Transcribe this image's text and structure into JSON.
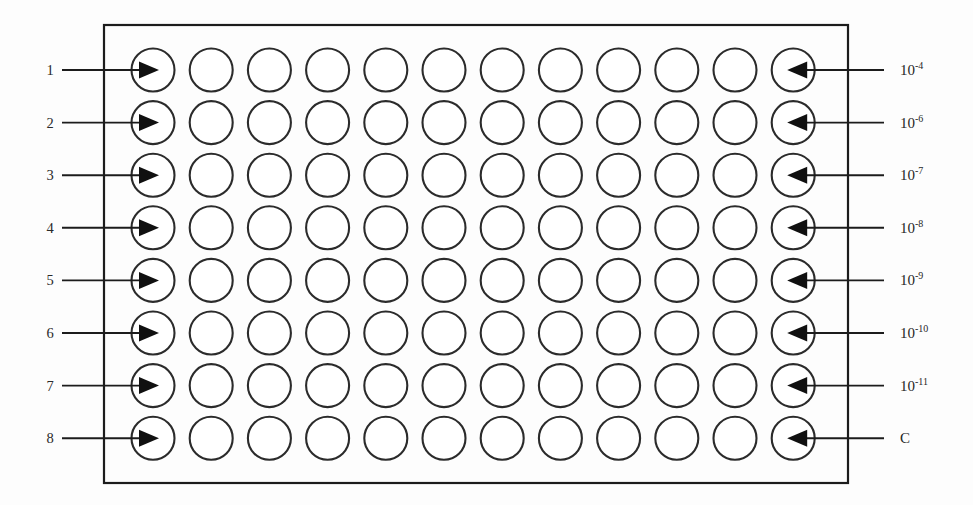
{
  "diagram": {
    "plate": {
      "rows": 8,
      "columns": 12,
      "well_shape": "circle",
      "border_color": "#1c1c1c",
      "well_stroke_color": "#2b2b2b",
      "background_color": "#fdfdfd"
    },
    "left_axis": {
      "name": "row-numbers",
      "arrow_direction": "right",
      "target_column": 1,
      "items": [
        {
          "label": "1",
          "row": 1
        },
        {
          "label": "2",
          "row": 2
        },
        {
          "label": "3",
          "row": 3
        },
        {
          "label": "4",
          "row": 4
        },
        {
          "label": "5",
          "row": 5
        },
        {
          "label": "6",
          "row": 6
        },
        {
          "label": "7",
          "row": 7
        },
        {
          "label": "8",
          "row": 8
        }
      ]
    },
    "right_axis": {
      "name": "concentration-labels",
      "arrow_direction": "left",
      "target_column": 12,
      "items": [
        {
          "base": "10",
          "exponent": "-4",
          "row": 1
        },
        {
          "base": "10",
          "exponent": "-6",
          "row": 2
        },
        {
          "base": "10",
          "exponent": "-7",
          "row": 3
        },
        {
          "base": "10",
          "exponent": "-8",
          "row": 4
        },
        {
          "base": "10",
          "exponent": "-9",
          "row": 5
        },
        {
          "base": "10",
          "exponent": "-10",
          "row": 6
        },
        {
          "base": "10",
          "exponent": "-11",
          "row": 7
        },
        {
          "base": "C",
          "exponent": "",
          "row": 8
        }
      ]
    }
  }
}
